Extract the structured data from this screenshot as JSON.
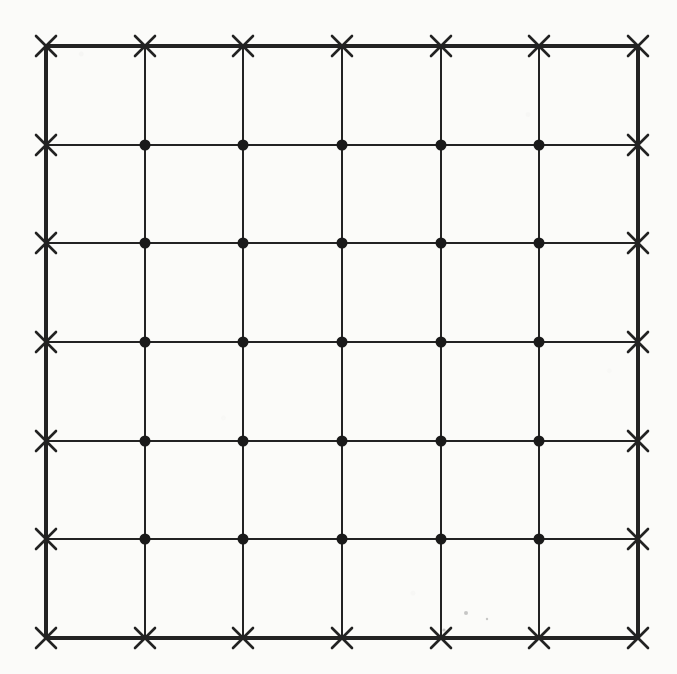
{
  "figure": {
    "kind": "lattice-grid-diagram",
    "background_color": "#fbfbf9",
    "ink_color": "#222222",
    "canvas": {
      "width": 677,
      "height": 674
    }
  },
  "chart_data": {
    "type": "scatter",
    "title": "",
    "subtitle": "",
    "xlabel": "",
    "ylabel": "",
    "grid": true,
    "legend_position": "none",
    "xlim": [
      46,
      638
    ],
    "ylim": [
      46,
      638
    ],
    "x_tick_labels": [],
    "y_tick_labels": [],
    "cells_x": 6,
    "cells_y": 6,
    "nodes_x": 7,
    "nodes_y": 7,
    "spacing_px": 98.67,
    "x": [
      46,
      145,
      243,
      342,
      441,
      539,
      638
    ],
    "y": [
      46,
      145,
      243,
      342,
      441,
      539,
      638
    ],
    "series": [
      {
        "name": "boundary-nodes",
        "marker": "x-cross",
        "marker_size": 20,
        "color": "#222222",
        "count": 24,
        "points": [
          [
            46,
            46
          ],
          [
            145,
            46
          ],
          [
            243,
            46
          ],
          [
            342,
            46
          ],
          [
            441,
            46
          ],
          [
            539,
            46
          ],
          [
            638,
            46
          ],
          [
            46,
            145
          ],
          [
            638,
            145
          ],
          [
            46,
            243
          ],
          [
            638,
            243
          ],
          [
            46,
            342
          ],
          [
            638,
            342
          ],
          [
            46,
            441
          ],
          [
            638,
            441
          ],
          [
            46,
            539
          ],
          [
            638,
            539
          ],
          [
            46,
            638
          ],
          [
            145,
            638
          ],
          [
            243,
            638
          ],
          [
            342,
            638
          ],
          [
            441,
            638
          ],
          [
            539,
            638
          ],
          [
            638,
            638
          ]
        ]
      },
      {
        "name": "interior-nodes",
        "marker": "filled-circle",
        "marker_size": 11,
        "color": "#1a1a1a",
        "count": 25,
        "points": [
          [
            145,
            145
          ],
          [
            243,
            145
          ],
          [
            342,
            145
          ],
          [
            441,
            145
          ],
          [
            539,
            145
          ],
          [
            145,
            243
          ],
          [
            243,
            243
          ],
          [
            342,
            243
          ],
          [
            441,
            243
          ],
          [
            539,
            243
          ],
          [
            145,
            342
          ],
          [
            243,
            342
          ],
          [
            342,
            342
          ],
          [
            441,
            342
          ],
          [
            539,
            342
          ],
          [
            145,
            441
          ],
          [
            243,
            441
          ],
          [
            342,
            441
          ],
          [
            441,
            441
          ],
          [
            539,
            441
          ],
          [
            145,
            539
          ],
          [
            243,
            539
          ],
          [
            342,
            539
          ],
          [
            441,
            539
          ],
          [
            539,
            539
          ]
        ]
      }
    ],
    "lines": {
      "boundary_stroke_width": 4,
      "interior_stroke_width": 2,
      "stroke_color": "#232323",
      "vertical_x": [
        46,
        145,
        243,
        342,
        441,
        539,
        638
      ],
      "horizontal_y": [
        46,
        145,
        243,
        342,
        441,
        539,
        638
      ]
    },
    "specks": [
      {
        "x": 466,
        "y": 613,
        "r": 2.0
      },
      {
        "x": 444,
        "y": 630,
        "r": 1.6
      },
      {
        "x": 487,
        "y": 619,
        "r": 1.2
      }
    ]
  }
}
